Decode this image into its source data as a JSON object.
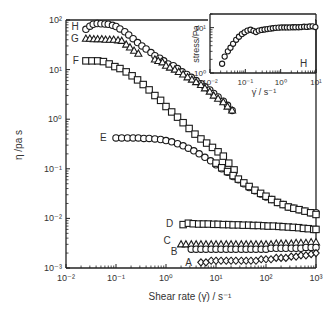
{
  "chart_data": [
    {
      "type": "scatter",
      "title": "",
      "xlabel": "Shear rate (γ̇) / s⁻¹",
      "ylabel": "η /pa s",
      "xscale": "log",
      "yscale": "log",
      "xlim": [
        0.01,
        1000
      ],
      "ylim": [
        0.001,
        100
      ],
      "x_ticks": [
        "10⁻²",
        "10⁻¹",
        "10⁰",
        "10¹",
        "10²",
        "10³"
      ],
      "y_ticks": [
        "10⁻³",
        "10⁻²",
        "10⁻¹",
        "10⁰",
        "10¹",
        "10²"
      ],
      "grid": false,
      "legend": "inline labels A–H placed left of each curve",
      "series": [
        {
          "name": "H",
          "marker": "circle",
          "x": [
            0.025,
            0.03,
            0.035,
            0.042,
            0.05,
            0.06,
            0.07,
            0.085,
            0.1,
            0.12,
            0.15,
            0.18,
            0.22,
            0.27,
            0.33,
            0.4,
            0.5,
            0.6,
            0.75,
            0.9,
            1.1,
            1.4,
            1.7,
            2.1,
            2.6,
            3.2,
            4,
            5,
            6,
            7.5,
            9,
            11,
            14,
            17,
            21
          ],
          "y": [
            65,
            75,
            82,
            85,
            84,
            83,
            82,
            78,
            74,
            66,
            58,
            50,
            42,
            35,
            30,
            26,
            22,
            19,
            17,
            15,
            13,
            12,
            10.5,
            9,
            8,
            7,
            6,
            5.2,
            4.5,
            3.9,
            3.3,
            2.8,
            2.3,
            1.9,
            1.5
          ]
        },
        {
          "name": "G",
          "marker": "triangle",
          "x": [
            0.025,
            0.03,
            0.036,
            0.043,
            0.052,
            0.062,
            0.075,
            0.09,
            0.11,
            0.13,
            0.16,
            0.19,
            0.23,
            0.28,
            0.6,
            0.7,
            0.85,
            1.0,
            1.2,
            1.5,
            1.8,
            2.2,
            2.7,
            3.3,
            4,
            5,
            6,
            7.5,
            9,
            11,
            14,
            17,
            21
          ],
          "y": [
            42,
            42,
            41,
            41,
            41,
            40,
            40,
            40,
            39,
            38,
            32,
            28,
            24,
            21,
            16,
            15,
            14,
            12,
            11,
            10,
            9,
            8,
            7,
            6.3,
            5.6,
            4.9,
            4.2,
            3.6,
            3.0,
            2.6,
            2.2,
            1.8,
            1.5
          ]
        },
        {
          "name": "F",
          "marker": "square",
          "x": [
            0.025,
            0.033,
            0.043,
            0.056,
            0.073,
            0.095,
            0.12,
            0.16,
            0.21,
            0.27,
            0.35,
            0.46,
            0.6,
            0.78,
            1.0,
            1.3,
            1.7,
            2.2,
            2.9,
            3.8,
            5,
            6.5,
            8.5,
            11,
            14,
            18,
            23
          ],
          "y": [
            15,
            15,
            15,
            14.5,
            13,
            11.5,
            10.5,
            9,
            7.5,
            6.2,
            5,
            3.9,
            3.0,
            2.4,
            1.8,
            1.4,
            1.1,
            0.85,
            0.65,
            0.5,
            0.4,
            0.33,
            0.27,
            0.22,
            0.18,
            0.13,
            0.095
          ]
        },
        {
          "name": "E",
          "marker": "circle",
          "x": [
            0.1,
            0.13,
            0.17,
            0.22,
            0.28,
            0.36,
            0.46,
            0.6,
            0.78,
            1.0,
            1.3,
            1.7,
            2.2,
            2.8,
            3.6,
            4.6,
            6,
            7.8,
            10,
            13,
            17,
            22,
            28,
            36,
            46,
            60,
            78,
            100,
            130,
            170,
            220,
            280,
            360,
            460,
            600,
            780,
            1000
          ],
          "y": [
            0.42,
            0.42,
            0.42,
            0.42,
            0.42,
            0.41,
            0.41,
            0.4,
            0.39,
            0.37,
            0.35,
            0.32,
            0.29,
            0.26,
            0.23,
            0.2,
            0.17,
            0.145,
            0.12,
            0.1,
            0.085,
            0.07,
            0.06,
            0.05,
            0.042,
            0.036,
            0.031,
            0.027,
            0.024,
            0.021,
            0.019,
            0.017,
            0.016,
            0.015,
            0.014,
            0.013,
            0.013
          ]
        },
        {
          "name": "E (square overlay)",
          "marker": "square",
          "x": [
            10,
            13,
            17,
            22,
            28,
            36,
            46,
            60,
            78,
            100,
            130,
            170,
            220,
            280,
            360,
            460,
            600,
            780,
            1000
          ],
          "y": [
            0.13,
            0.105,
            0.088,
            0.073,
            0.062,
            0.052,
            0.044,
            0.037,
            0.032,
            0.028,
            0.024,
            0.021,
            0.019,
            0.017,
            0.016,
            0.015,
            0.014,
            0.013,
            0.012
          ]
        },
        {
          "name": "D",
          "marker": "square",
          "x": [
            2.2,
            2.8,
            3.5,
            4.5,
            5.6,
            7,
            9,
            11,
            14,
            18,
            22,
            28,
            35,
            45,
            56,
            70,
            90,
            110,
            140,
            180,
            220,
            280,
            350,
            450,
            560,
            700,
            900,
            1000
          ],
          "y": [
            0.0075,
            0.008,
            0.0078,
            0.0077,
            0.0077,
            0.0077,
            0.0076,
            0.0076,
            0.0075,
            0.0075,
            0.0074,
            0.0074,
            0.0073,
            0.0073,
            0.0072,
            0.0072,
            0.0071,
            0.007,
            0.007,
            0.0069,
            0.0068,
            0.0067,
            0.0066,
            0.0065,
            0.0063,
            0.0062,
            0.006,
            0.006
          ]
        },
        {
          "name": "C",
          "marker": "triangle",
          "x": [
            2.0,
            2.5,
            3.2,
            4,
            5,
            6.3,
            8,
            10,
            12.6,
            16,
            20,
            25,
            32,
            40,
            50,
            63,
            80,
            100,
            126,
            160,
            200,
            250,
            320,
            400,
            500,
            630,
            800,
            1000
          ],
          "y": [
            0.003,
            0.003,
            0.003,
            0.003,
            0.003,
            0.003,
            0.003,
            0.003,
            0.003,
            0.003,
            0.003,
            0.003,
            0.003,
            0.003,
            0.003,
            0.003,
            0.003,
            0.003,
            0.003,
            0.0031,
            0.0031,
            0.0031,
            0.0031,
            0.0032,
            0.0032,
            0.0032,
            0.0033,
            0.0033
          ]
        },
        {
          "name": "B",
          "marker": "circle",
          "x": [
            3.2,
            4,
            5,
            6.3,
            8,
            10,
            12.6,
            16,
            20,
            25,
            32,
            40,
            50,
            63,
            80,
            100,
            126,
            160,
            200,
            250,
            320,
            400,
            500,
            630,
            800,
            1000
          ],
          "y": [
            0.0024,
            0.0024,
            0.0024,
            0.0024,
            0.0024,
            0.0024,
            0.0024,
            0.0024,
            0.0024,
            0.0024,
            0.0024,
            0.0024,
            0.0024,
            0.0024,
            0.0024,
            0.0024,
            0.0025,
            0.0025,
            0.0025,
            0.0025,
            0.0025,
            0.0025,
            0.0025,
            0.0026,
            0.0026,
            0.0026
          ]
        },
        {
          "name": "A",
          "marker": "diamond",
          "x": [
            5,
            6.3,
            8,
            10,
            12.6,
            16,
            20,
            25,
            32,
            40,
            50,
            63,
            80,
            100,
            126,
            160,
            200,
            250,
            320,
            400,
            500,
            630,
            800,
            1000
          ],
          "y": [
            0.0013,
            0.0013,
            0.0014,
            0.0014,
            0.0014,
            0.0014,
            0.0014,
            0.0014,
            0.0014,
            0.0014,
            0.0014,
            0.0014,
            0.0015,
            0.0015,
            0.0015,
            0.0016,
            0.0016,
            0.0016,
            0.0017,
            0.0017,
            0.0018,
            0.0018,
            0.0019,
            0.002
          ]
        }
      ],
      "annotations": [
        "H",
        "G",
        "F",
        "E",
        "D",
        "C",
        "B",
        "A"
      ]
    },
    {
      "type": "scatter",
      "title": "inset",
      "xlabel": "γ̇ / s⁻¹",
      "ylabel": "stress/Pa",
      "xscale": "log",
      "yscale": "log",
      "xlim": [
        0.01,
        10
      ],
      "ylim": [
        1,
        20
      ],
      "x_ticks": [
        "10⁻²",
        "10⁻¹",
        "10⁰",
        "10¹"
      ],
      "y_ticks": [
        "10⁰",
        "10¹"
      ],
      "grid": false,
      "annotations": [
        "H"
      ],
      "series": [
        {
          "name": "H",
          "marker": "circle",
          "x": [
            0.022,
            0.026,
            0.032,
            0.038,
            0.045,
            0.055,
            0.066,
            0.08,
            0.095,
            0.115,
            0.14,
            0.17,
            0.2,
            0.24,
            0.29,
            0.35,
            0.42,
            0.5,
            0.6,
            0.72,
            0.87,
            1.05,
            1.26,
            1.5,
            1.8,
            2.2,
            2.6,
            3.2,
            3.8,
            4.6,
            5.5,
            6.6,
            8,
            9.6
          ],
          "y": [
            1.6,
            2.3,
            3.0,
            3.6,
            4.4,
            5.4,
            6.3,
            7.2,
            7.9,
            8.6,
            9.0,
            8.5,
            8.0,
            8.6,
            8.9,
            9.1,
            9.3,
            9.5,
            9.7,
            9.9,
            10.0,
            10.1,
            10.1,
            10.1,
            10.1,
            10.2,
            10.2,
            10.2,
            10.3,
            10.5,
            10.4,
            10.6,
            10.7,
            10.3
          ]
        }
      ]
    }
  ],
  "axes_text": {
    "main": {
      "xlabel": "Shear rate (γ̇) / s⁻¹",
      "ylabel": "η /pa s",
      "xticks": [
        "10⁻²",
        "10⁻¹",
        "10⁰",
        "10¹",
        "10²",
        "10³"
      ],
      "yticks": [
        "10²",
        "10¹",
        "10⁰",
        "10⁻¹",
        "10⁻²",
        "10⁻³"
      ]
    },
    "inset": {
      "xlabel": "γ̇ / s⁻¹",
      "ylabel": "stress/Pa",
      "xticks": [
        "10⁻²",
        "10⁻¹",
        "10⁰",
        "10¹"
      ],
      "yticks": [
        "10¹",
        "10⁰"
      ],
      "label": "H"
    }
  },
  "colors": {
    "axis": "#222222",
    "marker": "#1a1a1a",
    "text": "#333333",
    "background": "#ffffff"
  }
}
